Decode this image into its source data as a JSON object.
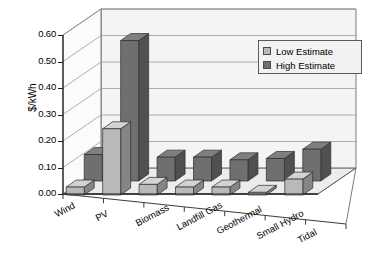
{
  "chart_data": {
    "type": "bar",
    "title": "",
    "subtitle": "",
    "xlabel": "",
    "ylabel": "$/kWh",
    "ylim": [
      0.0,
      0.6
    ],
    "ytick_labels": [
      "0.00",
      "0.10",
      "0.20",
      "0.30",
      "0.40",
      "0.50",
      "0.60"
    ],
    "ytick_values": [
      0.0,
      0.1,
      0.2,
      0.3,
      0.4,
      0.5,
      0.6
    ],
    "grid": true,
    "three_d": true,
    "legend_position": "top-right",
    "categories": [
      "Wind",
      "PV",
      "Biomass",
      "Landfill Gas",
      "Geothermal",
      "Small Hydro",
      "Tidal"
    ],
    "series": [
      {
        "name": "Low Estimate",
        "color": "#b9b9b9",
        "values": [
          0.03,
          0.25,
          0.04,
          0.03,
          0.03,
          0.01,
          0.06
        ]
      },
      {
        "name": "High Estimate",
        "color": "#6f6f6f",
        "values": [
          0.1,
          0.53,
          0.09,
          0.09,
          0.08,
          0.085,
          0.12
        ]
      }
    ]
  },
  "legend": {
    "items": [
      {
        "label": "Low Estimate"
      },
      {
        "label": "High Estimate"
      }
    ]
  },
  "colors": {
    "low_face": "#b9b9b9",
    "high_face": "#6f6f6f",
    "plot_back": "#f4f4f4",
    "plot_floor": "#ececec",
    "gridline": "#9a9a9a",
    "axis": "#1a1a1a"
  }
}
